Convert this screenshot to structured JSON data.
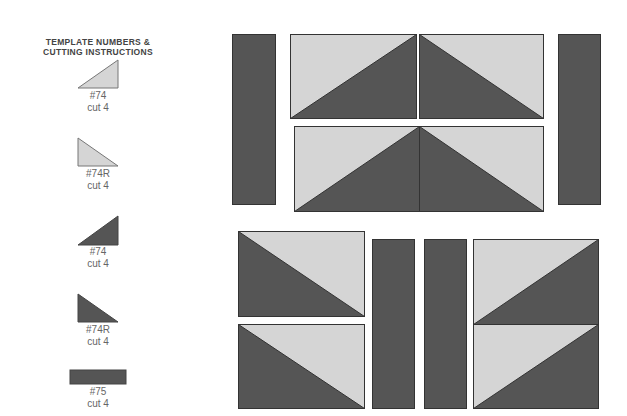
{
  "legend": {
    "title_line1": "TEMPLATE NUMBERS &",
    "title_line2": "CUTTING INSTRUCTIONS",
    "items": [
      {
        "template": "#74",
        "cut": "cut 4",
        "shape": "triangle-right-up",
        "fill": "light"
      },
      {
        "template": "#74R",
        "cut": "cut 4",
        "shape": "triangle-left-down",
        "fill": "light"
      },
      {
        "template": "#74",
        "cut": "cut 4",
        "shape": "triangle-right-up",
        "fill": "dark"
      },
      {
        "template": "#74R",
        "cut": "cut 4",
        "shape": "triangle-left-down",
        "fill": "dark"
      },
      {
        "template": "#75",
        "cut": "cut 4",
        "shape": "rectangle",
        "fill": "dark"
      }
    ]
  },
  "colors": {
    "light": "#d5d5d5",
    "dark": "#555555",
    "stroke": "#333333",
    "text": "#666666"
  }
}
